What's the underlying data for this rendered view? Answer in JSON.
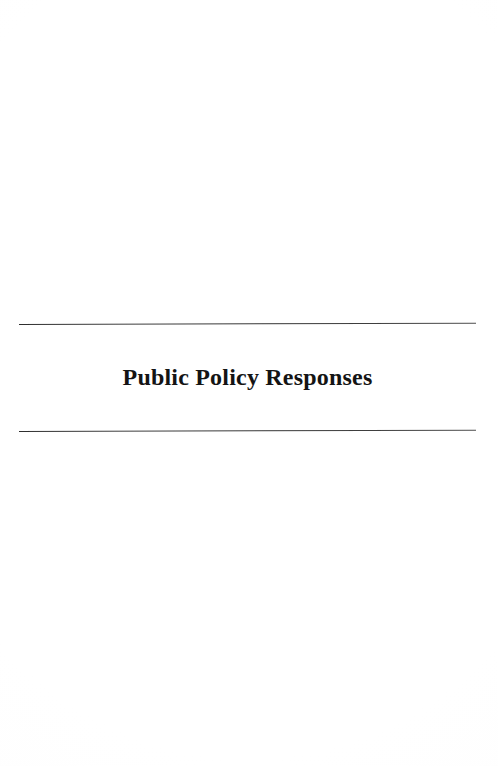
{
  "document": {
    "type": "scanned-book-part-title-page",
    "page_background": "#ffffff",
    "ink_color": "#141414",
    "rule_color": "#3a3a3a"
  },
  "divider": {
    "title": "Public Policy Responses",
    "top_rule_label": "horizontal rule above title",
    "bottom_rule_label": "horizontal rule below title"
  },
  "body": {
    "upper_blank_label": "blank upper page area",
    "lower_blank_label": "blank lower page area"
  }
}
